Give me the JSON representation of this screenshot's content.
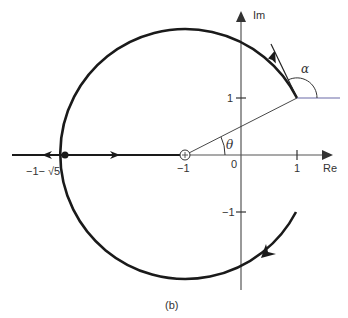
{
  "figure": {
    "caption": "(b)",
    "type": "root locus",
    "axes": {
      "real_label": "Re",
      "imag_label": "Im",
      "real_ticks": [
        {
          "value": -1,
          "label": "−1"
        },
        {
          "value": 0,
          "label": "0"
        },
        {
          "value": 1,
          "label": "1"
        }
      ],
      "imag_ticks": [
        {
          "value": 1,
          "label": "1"
        },
        {
          "value": -1,
          "label": "−1"
        }
      ]
    },
    "annotations": {
      "breakaway_label": "−1− √5",
      "theta_label": "θ",
      "alpha_label": "α"
    },
    "elements": {
      "circle_center": [
        -1,
        0
      ],
      "circle_radius": "√5",
      "pole_marker": [
        -1,
        0
      ],
      "breakaway_point": "-1-√5",
      "departure_point": [
        1,
        1
      ],
      "arrival_point": [
        1,
        -1
      ]
    },
    "colors": {
      "locus": "#1a1a1a",
      "axis": "#555555",
      "reference_line": "#6a6aa8"
    }
  }
}
